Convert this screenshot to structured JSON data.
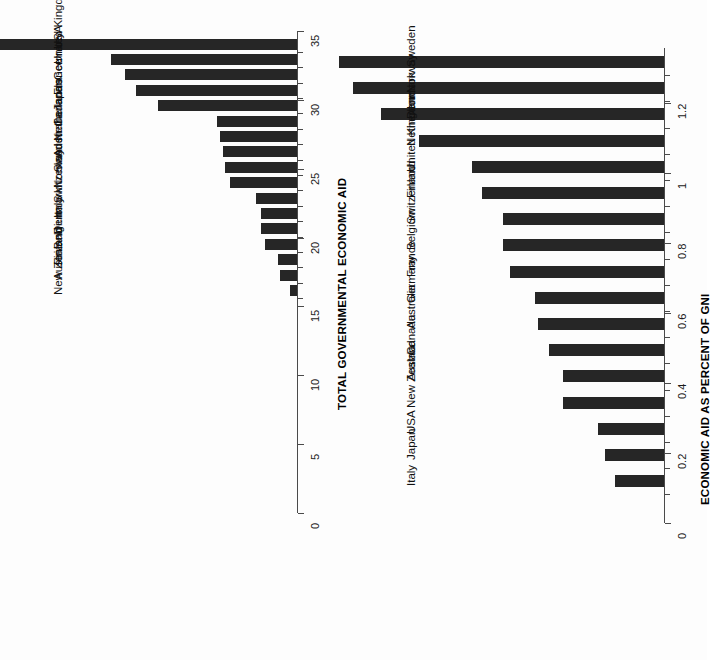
{
  "figure": {
    "background": "#fdfdfd",
    "bar_color": "#262626",
    "axis_color": "#4a4a4a",
    "orientation": "rotated-90-bar-charts",
    "panel_count": 2
  },
  "chart_data": [
    {
      "type": "bar",
      "panel": "left",
      "title": "",
      "xlabel": "",
      "ylabel": "TOTAL GOVERNMENTAL ECONOMIC AID",
      "ylim": [
        0,
        35
      ],
      "yticks": [
        0,
        5,
        10,
        15,
        20,
        25,
        30,
        35
      ],
      "ytick_labels": [
        "0",
        "5",
        "10",
        "15",
        "20",
        "25",
        "30",
        "35"
      ],
      "grid": false,
      "legend": null,
      "categories": [
        "USA",
        "United Kingdom",
        "Germany",
        "France",
        "Japan",
        "Canada",
        "Netherlands",
        "Australia",
        "Sweden",
        "Norway",
        "Switzerland",
        "Italy",
        "Denmark",
        "Belgium",
        "Finland",
        "Austria",
        "New Zealand"
      ],
      "values": [
        30.3,
        13.5,
        12.5,
        11.7,
        10.1,
        5.8,
        5.6,
        5.4,
        5.2,
        4.9,
        3.0,
        2.6,
        2.6,
        2.3,
        1.4,
        1.2,
        0.5
      ]
    },
    {
      "type": "bar",
      "panel": "right",
      "title": "",
      "xlabel": "",
      "ylabel": "ECONOMIC AID AS PERCENT OF GNI",
      "ylim": [
        0,
        1.2
      ],
      "yticks": [
        0,
        0.2,
        0.4,
        0.6,
        0.8,
        1,
        1.2
      ],
      "ytick_labels": [
        "0",
        "0.2",
        "0.4",
        "0.6",
        "0.8",
        "1",
        "1.2"
      ],
      "grid": false,
      "legend": null,
      "categories": [
        "Sweden",
        "Norway",
        "Denmark",
        "Netherlands",
        "United Kingdom",
        "Finland",
        "Switzerland",
        "Belgium",
        "France",
        "Germany",
        "Australia",
        "Canada",
        "Austria",
        "New Zealand",
        "USA",
        "Japan",
        "Italy"
      ],
      "values": [
        0.93,
        0.89,
        0.81,
        0.7,
        0.55,
        0.52,
        0.46,
        0.46,
        0.44,
        0.37,
        0.36,
        0.33,
        0.29,
        0.29,
        0.19,
        0.17,
        0.14
      ]
    }
  ],
  "layout": {
    "left_panel": {
      "baseline_x": 297,
      "axis_top_y": 31,
      "axis_bottom_y": 513,
      "px_per_unit": 13.77,
      "first_cat_y": 44,
      "cat_step": 15.4,
      "bar_thickness": 11,
      "tick_label_offset": 12,
      "cat_label_offset": 14,
      "axis_title_x": 336,
      "axis_title_y": 410
    },
    "right_panel": {
      "baseline_x": 664,
      "axis_top_y": 103,
      "axis_bottom_y": 523,
      "px_per_unit": 349.2,
      "first_cat_y": 62,
      "cat_step": 26.2,
      "bar_thickness": 12,
      "tick_label_offset": 12,
      "cat_label_offset": 14,
      "axis_title_x": 699,
      "axis_title_y": 505
    }
  }
}
